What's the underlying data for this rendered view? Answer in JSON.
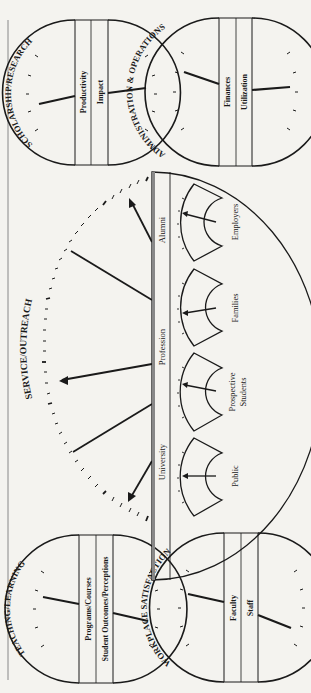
{
  "figure": {
    "orientation": "rotated-90-ccw",
    "colors": {
      "ink": "#1a1a1a",
      "paper": "#f4f3ef",
      "rule": "#777777"
    }
  },
  "gauges": {
    "scholarship": {
      "title": "SCHOLARSHIP/RESEARCH",
      "bands": [
        "Productivity",
        "Impact"
      ]
    },
    "administration": {
      "title": "ADMINISTRATION & OPERATIONS",
      "bands": [
        "Finances",
        "Utilization"
      ]
    },
    "teaching": {
      "title": "TEACHING/LEARNING",
      "bands": [
        "Programs/Courses",
        "Student Outcomes/Perceptions"
      ]
    },
    "workplace": {
      "title": "WORKPLACE SATISFACTION",
      "bands": [
        "Faculty",
        "Staff"
      ]
    }
  },
  "service": {
    "title": "SERVICE/OUTREACH",
    "header": [
      "University",
      "Profession",
      "Alumni"
    ],
    "mini_gauges": [
      "Public",
      "Prospective",
      "Students",
      "Families",
      "Employers"
    ]
  }
}
